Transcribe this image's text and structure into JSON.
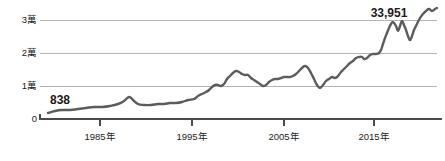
{
  "chart_data": {
    "type": "line",
    "title": "",
    "subtitle": "",
    "xlabel": "",
    "ylabel": "",
    "grid": true,
    "legend": "none",
    "xlim": [
      1981,
      2021
    ],
    "ylim": [
      0,
      36000
    ],
    "y_ticks": [
      {
        "value": 0,
        "label": "0"
      },
      {
        "value": 10000,
        "label": "1萬"
      },
      {
        "value": 20000,
        "label": "2萬"
      },
      {
        "value": 30000,
        "label": "3萬"
      }
    ],
    "x_ticks": [
      {
        "value": 1985,
        "label": "1985年"
      },
      {
        "value": 1995,
        "label": "1995年"
      },
      {
        "value": 2005,
        "label": "2005年"
      },
      {
        "value": 2015,
        "label": "2015年"
      }
    ],
    "annotations": [
      {
        "name": "start-value",
        "label": "838",
        "x": 1981,
        "y": 838
      },
      {
        "name": "end-value",
        "label": "33,951",
        "x": 2021,
        "y": 33951
      }
    ],
    "series": [
      {
        "name": "index",
        "color": "#5c5c5c",
        "x": [
          1981,
          1982,
          1983,
          1984,
          1985,
          1986,
          1987,
          1988,
          1989,
          1990,
          1991,
          1992,
          1993,
          1994,
          1995,
          1996,
          1997,
          1998,
          1999,
          2000,
          2001,
          2002,
          2003,
          2004,
          2005,
          2006,
          2007,
          2008,
          2009,
          2010,
          2011,
          2012,
          2013,
          2014,
          2015,
          2016,
          2017,
          2018,
          2019,
          2020,
          2021
        ],
        "values": [
          838,
          1400,
          1800,
          2100,
          2300,
          2500,
          2400,
          2700,
          3100,
          4800,
          3300,
          3200,
          3300,
          3900,
          4400,
          5100,
          5400,
          6500,
          7000,
          9200,
          8700,
          7500,
          6500,
          6100,
          6500,
          7200,
          7100,
          6200,
          5400,
          7200,
          6900,
          7300,
          8500,
          9100,
          9500,
          8700,
          10600,
          11300,
          12000,
          11400,
          14000
        ],
        "note": "line reconstructed from pixel trace; index level (萬 = 10,000)"
      }
    ],
    "trace_points_pixel": [
      [
        48,
        113
      ],
      [
        55,
        111
      ],
      [
        62,
        110
      ],
      [
        70,
        110
      ],
      [
        78,
        109
      ],
      [
        86,
        108
      ],
      [
        94,
        107
      ],
      [
        102,
        107
      ],
      [
        110,
        106
      ],
      [
        118,
        104
      ],
      [
        124,
        101
      ],
      [
        129,
        97
      ],
      [
        133,
        100
      ],
      [
        138,
        104
      ],
      [
        144,
        105
      ],
      [
        151,
        105
      ],
      [
        158,
        104
      ],
      [
        164,
        104
      ],
      [
        170,
        103
      ],
      [
        176,
        103
      ],
      [
        182,
        102
      ],
      [
        188,
        100
      ],
      [
        194,
        99
      ],
      [
        198,
        96
      ],
      [
        202,
        94
      ],
      [
        206,
        92
      ],
      [
        209,
        90
      ],
      [
        212,
        87
      ],
      [
        215,
        85
      ],
      [
        218,
        85
      ],
      [
        221,
        86
      ],
      [
        224,
        84
      ],
      [
        227,
        79
      ],
      [
        230,
        76
      ],
      [
        233,
        73
      ],
      [
        236,
        71
      ],
      [
        239,
        72
      ],
      [
        242,
        74
      ],
      [
        245,
        75
      ],
      [
        248,
        75
      ],
      [
        251,
        78
      ],
      [
        254,
        80
      ],
      [
        257,
        82
      ],
      [
        260,
        84
      ],
      [
        263,
        86
      ],
      [
        266,
        85
      ],
      [
        269,
        82
      ],
      [
        272,
        80
      ],
      [
        275,
        79
      ],
      [
        278,
        79
      ],
      [
        281,
        78
      ],
      [
        284,
        77
      ],
      [
        287,
        77
      ],
      [
        290,
        77
      ],
      [
        293,
        76
      ],
      [
        296,
        74
      ],
      [
        299,
        71
      ],
      [
        302,
        68
      ],
      [
        305,
        66
      ],
      [
        308,
        68
      ],
      [
        311,
        73
      ],
      [
        314,
        79
      ],
      [
        317,
        85
      ],
      [
        320,
        88
      ],
      [
        323,
        85
      ],
      [
        326,
        81
      ],
      [
        329,
        79
      ],
      [
        332,
        77
      ],
      [
        335,
        78
      ],
      [
        338,
        76
      ],
      [
        341,
        72
      ],
      [
        344,
        69
      ],
      [
        347,
        66
      ],
      [
        350,
        63
      ],
      [
        353,
        61
      ],
      [
        356,
        58
      ],
      [
        359,
        57
      ],
      [
        362,
        57
      ],
      [
        364,
        59
      ],
      [
        367,
        58
      ],
      [
        370,
        55
      ],
      [
        373,
        54
      ],
      [
        376,
        54
      ],
      [
        379,
        53
      ],
      [
        381,
        50
      ],
      [
        383,
        44
      ],
      [
        385,
        38
      ],
      [
        387,
        33
      ],
      [
        389,
        28
      ],
      [
        391,
        24
      ],
      [
        393,
        22
      ],
      [
        396,
        26
      ],
      [
        398,
        31
      ],
      [
        400,
        26
      ],
      [
        402,
        21
      ],
      [
        404,
        25
      ],
      [
        406,
        30
      ],
      [
        408,
        36
      ],
      [
        410,
        40
      ],
      [
        412,
        36
      ],
      [
        414,
        30
      ],
      [
        417,
        24
      ],
      [
        420,
        18
      ],
      [
        423,
        14
      ],
      [
        426,
        11
      ],
      [
        429,
        9
      ],
      [
        432,
        11
      ],
      [
        435,
        9
      ],
      [
        437,
        8
      ]
    ]
  },
  "layout": {
    "plot_left": 48,
    "plot_right": 437,
    "baseline_y": 119,
    "gridline_y": {
      "y10000": 86,
      "y20000": 53,
      "y30000": 20
    },
    "xtick_x": [
      100,
      192,
      284,
      374
    ],
    "colors": {
      "line": "#5c5c5c",
      "grid": "#b4b4b4",
      "axis": "#4a4a4a",
      "text": "#222222",
      "annotation": "#1a1a1a",
      "background": "#ffffff"
    }
  }
}
